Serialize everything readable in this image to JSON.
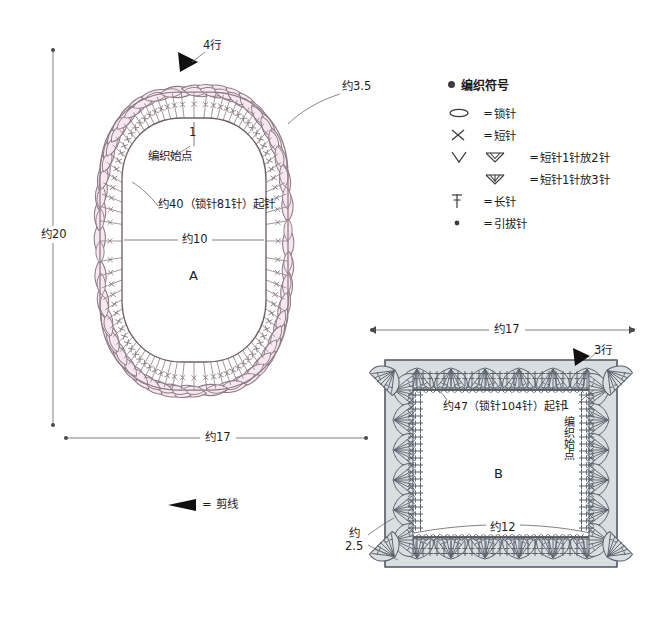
{
  "page": {
    "bg": "#ffffff",
    "ink": "#4a4248",
    "pink_fill": "#f7e7ee",
    "pink_stroke": "#8c7b84",
    "gray_fill": "#d9dee1",
    "gray_stroke": "#58606a",
    "dim_line": "#6b6b6b"
  },
  "legend": {
    "heading": "编织符号",
    "items": [
      {
        "icon": "chain-stitch-oval-icon",
        "symbol": "oval",
        "eq": "=",
        "label": "锁针"
      },
      {
        "icon": "single-crochet-cross-icon",
        "symbol": "cross",
        "eq": "=",
        "label": "短针"
      },
      {
        "icon": "two-in-one-v-icon",
        "symbol": "v-and-w2",
        "eq": "=",
        "label": "短针1针放2针"
      },
      {
        "icon": "three-in-one-w-icon",
        "symbol": "w3",
        "eq": "=",
        "label": "短针1针放3针"
      },
      {
        "icon": "double-crochet-tbar-icon",
        "symbol": "tbar",
        "eq": "=",
        "label": "长针"
      },
      {
        "icon": "slip-stitch-dot-icon",
        "symbol": "dot",
        "eq": "=",
        "label": "引拔针"
      }
    ]
  },
  "cut_legend": {
    "icon": "cut-thread-arrow-icon",
    "eq": "=",
    "label": "剪线"
  },
  "diagram_a": {
    "name": "A",
    "letter": "A",
    "rows_marker": "4行",
    "start_number": "1",
    "start_label": "编织始点",
    "petal_size": "约3.5",
    "foundation": "约40（锁针81针）起针",
    "inner_width": "约10",
    "height_dim": "约20",
    "width_dim": "约17"
  },
  "diagram_b": {
    "name": "B",
    "letter": "B",
    "rows_marker": "3行",
    "start_number": "1",
    "start_label": "编织始点",
    "foundation": "约47（锁针104针）起针",
    "inner_width": "约12",
    "width_dim": "约17",
    "edge_dim": "约\n2.5"
  }
}
